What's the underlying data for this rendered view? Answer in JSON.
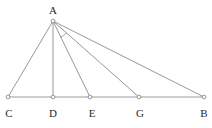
{
  "figure": {
    "background_color": "#ffffff",
    "line_color": "#8c8c8c",
    "label_color": "#2b2b2b",
    "canvas": {
      "width": 212,
      "height": 128
    }
  },
  "points": {
    "A": {
      "label": "A",
      "x": 53,
      "y": 21,
      "label_x": 53,
      "label_y": 14
    },
    "C": {
      "label": "C",
      "x": 8,
      "y": 97,
      "label_x": 9,
      "label_y": 117
    },
    "D": {
      "label": "D",
      "x": 53,
      "y": 97,
      "label_x": 53,
      "label_y": 117
    },
    "E": {
      "label": "E",
      "x": 90,
      "y": 97,
      "label_x": 92,
      "label_y": 117
    },
    "G": {
      "label": "G",
      "x": 139,
      "y": 97,
      "label_x": 140,
      "label_y": 117
    },
    "B": {
      "label": "B",
      "x": 204,
      "y": 97,
      "label_x": 204,
      "label_y": 117
    }
  },
  "segments": [
    {
      "name": "base-CB",
      "from": "C",
      "to": "B"
    },
    {
      "name": "side-AC",
      "from": "A",
      "to": "C"
    },
    {
      "name": "altitude-AD",
      "from": "A",
      "to": "D"
    },
    {
      "name": "cevian-AE",
      "from": "A",
      "to": "E"
    },
    {
      "name": "cevian-AG",
      "from": "A",
      "to": "G"
    },
    {
      "name": "side-AB",
      "from": "A",
      "to": "B"
    }
  ],
  "angle_marks": [
    {
      "name": "angle-at-A",
      "vertex": "A",
      "radius": 18,
      "from": "E",
      "to": "G"
    }
  ]
}
